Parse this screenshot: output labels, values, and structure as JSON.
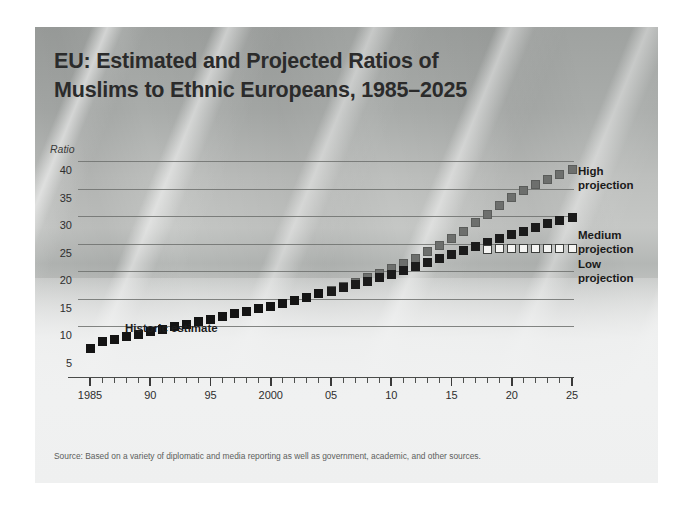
{
  "title": {
    "line1": "EU: Estimated and Projected Ratios of",
    "line2": "Muslims to Ethnic Europeans, 1985–2025"
  },
  "source": "Source: Based on a variety of diplomatic and media reporting as well as government, academic, and other sources.",
  "annotations": {
    "historic": "Historic estimate"
  },
  "legend": [
    {
      "label": "High\nprojection",
      "color": "#6d6f6d",
      "key": "high"
    },
    {
      "label": "Medium\nprojection",
      "color": "#1b1b1b",
      "key": "medium"
    },
    {
      "label": "Low\nprojection",
      "color": "#f4f4f2",
      "key": "low"
    }
  ],
  "chart_data": {
    "type": "scatter",
    "title": "EU: Estimated and Projected Ratios of Muslims to Ethnic Europeans, 1985–2025",
    "xlabel": "",
    "ylabel": "Ratio",
    "xlim": [
      1985,
      2025
    ],
    "ylim": [
      5,
      40
    ],
    "yticks": [
      5,
      10,
      15,
      20,
      25,
      30,
      35,
      40
    ],
    "ytick_labels": [
      "5",
      "10",
      "15",
      "20",
      "25",
      "30",
      "35",
      "40"
    ],
    "xticks": [
      1985,
      1990,
      1995,
      2000,
      2005,
      2010,
      2015,
      2020,
      2025
    ],
    "xtick_labels": [
      "1985",
      "90",
      "95",
      "2000",
      "05",
      "10",
      "15",
      "20",
      "25"
    ],
    "minor_xticks": "every year",
    "grid": "horizontal",
    "legend_position": "right",
    "series": [
      {
        "name": "Historic estimate",
        "marker": "filled-black-square",
        "x": [
          1985,
          1986,
          1987,
          1988,
          1989,
          1990,
          1991,
          1992,
          1993,
          1994,
          1995,
          1996,
          1997,
          1998,
          1999,
          2000,
          2001,
          2002,
          2003,
          2004,
          2005
        ],
        "values": [
          6.0,
          7.2,
          7.6,
          8.2,
          8.6,
          9.1,
          9.5,
          10.0,
          10.4,
          10.9,
          11.3,
          11.8,
          12.3,
          12.7,
          13.2,
          13.6,
          14.2,
          14.7,
          15.2,
          15.9,
          16.4
        ]
      },
      {
        "name": "High projection",
        "marker": "filled-gray-square",
        "x": [
          2005,
          2006,
          2007,
          2008,
          2009,
          2010,
          2011,
          2012,
          2013,
          2014,
          2015,
          2016,
          2017,
          2018,
          2019,
          2020,
          2021,
          2022,
          2023,
          2024,
          2025
        ],
        "values": [
          16.6,
          17.3,
          18.0,
          18.8,
          19.6,
          20.5,
          21.4,
          22.4,
          23.5,
          24.7,
          25.9,
          27.3,
          28.8,
          30.3,
          31.9,
          33.4,
          34.7,
          35.8,
          36.6,
          37.6,
          38.5
        ]
      },
      {
        "name": "Medium projection",
        "marker": "filled-black-square",
        "x": [
          2005,
          2006,
          2007,
          2008,
          2009,
          2010,
          2011,
          2012,
          2013,
          2014,
          2015,
          2016,
          2017,
          2018,
          2019,
          2020,
          2021,
          2022,
          2023,
          2024,
          2025
        ],
        "values": [
          16.4,
          17.0,
          17.6,
          18.2,
          18.8,
          19.5,
          20.2,
          20.9,
          21.6,
          22.3,
          23.1,
          23.8,
          24.5,
          25.2,
          25.9,
          26.6,
          27.3,
          28.0,
          28.6,
          29.2,
          29.7
        ]
      },
      {
        "name": "Low projection",
        "marker": "open-white-square",
        "x": [
          2018,
          2019,
          2020,
          2021,
          2022,
          2023,
          2024,
          2025
        ],
        "values": [
          24.0,
          24.1,
          24.1,
          24.2,
          24.2,
          24.2,
          24.2,
          24.2
        ]
      }
    ]
  }
}
